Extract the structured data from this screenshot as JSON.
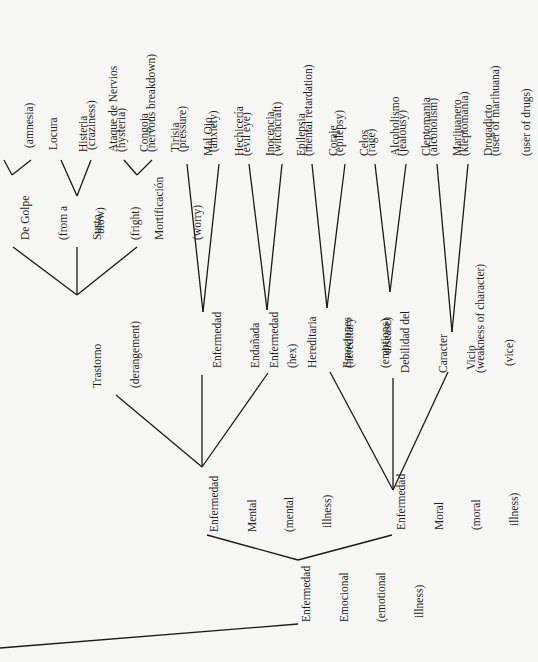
{
  "diagram": {
    "root": {
      "label": [
        "Enfermedad",
        "Emocional",
        "(emotional",
        "illness)"
      ],
      "children": [
        {
          "label": [
            "Enfermedad",
            "Mental",
            "(mental",
            "illness)"
          ],
          "children": [
            {
              "label": [
                "Trastorno",
                "(derangement)"
              ],
              "children": [
                {
                  "label": [
                    "De Golpe",
                    "(from a",
                    "blow)"
                  ],
                  "children": [
                    {
                      "label": [
                        "Amnesia",
                        "(amnesia)"
                      ]
                    },
                    {
                      "label": [
                        "Locura",
                        "(craziness)"
                      ]
                    }
                  ]
                },
                {
                  "label": [
                    "Susto",
                    "(fright)"
                  ],
                  "children": [
                    {
                      "label": [
                        "Histeria",
                        "(hysteria)"
                      ]
                    },
                    {
                      "label": [
                        "Ataque de Nervios",
                        "(nervous breakdown)"
                      ]
                    }
                  ]
                },
                {
                  "label": [
                    "Mortificación",
                    "(worry)"
                  ],
                  "children": [
                    {
                      "label": [
                        "Congoja",
                        "(pressure)"
                      ]
                    },
                    {
                      "label": [
                        "Tirisia",
                        "(anxiety)"
                      ]
                    }
                  ]
                }
              ]
            },
            {
              "label": [
                "Enfermedad",
                "Endañada",
                "(hex)"
              ],
              "children": [
                {
                  "label": [
                    "Mal Ojo",
                    "(evil eye)"
                  ]
                },
                {
                  "label": [
                    "Hechicería",
                    "(witchcraft)"
                  ]
                }
              ]
            },
            {
              "label": [
                "Enfermedad",
                "Hereditaria",
                "(hereditary",
                "disease)"
              ],
              "children": [
                {
                  "label": [
                    "Inocencia",
                    "(mental retardation)"
                  ]
                },
                {
                  "label": [
                    "Epilepsia",
                    "(epilepsy)"
                  ]
                }
              ]
            }
          ]
        },
        {
          "label": [
            "Enfermedad",
            "Moral",
            "(moral",
            "illness)"
          ],
          "children": [
            {
              "label": [
                "Emociones",
                "(emotions)"
              ],
              "children": [
                {
                  "label": [
                    "Coraje",
                    "(rage)"
                  ]
                },
                {
                  "label": [
                    "Celos",
                    "(jealousy)"
                  ]
                }
              ]
            },
            {
              "label": [
                "Debilidad del",
                "Caracter",
                "(weakness of character)"
              ],
              "children": [
                {
                  "label": [
                    "Alcoholismo",
                    "(alcoholism)"
                  ]
                },
                {
                  "label": [
                    "Cleptomania",
                    "(kleptomania)"
                  ]
                }
              ]
            },
            {
              "label": [
                "Vicio",
                "(vice)"
              ],
              "children": [
                {
                  "label": [
                    "Marijuanero",
                    "(user of marihuana)"
                  ]
                },
                {
                  "label": [
                    "Drogadicto",
                    "(user of drugs)"
                  ]
                }
              ]
            }
          ]
        }
      ]
    }
  },
  "labels": {
    "amnesia": [
      "(amnesia)"
    ],
    "degolpe": [
      "De Golpe",
      "(from a",
      "blow)"
    ],
    "locura": [
      "Locura",
      "(craziness)"
    ],
    "histeria": [
      "Histeria",
      "(hysteria)"
    ],
    "ataque": [
      "Ataque de Nervios",
      "(nervous breakdown)"
    ],
    "susto": [
      "Susto",
      "(fright)"
    ],
    "congoja": [
      "Congoja",
      "(pressure)"
    ],
    "tirisia": [
      "Tirisia",
      "(anxiety)"
    ],
    "mortificacion": [
      "Mortificación",
      "(worry)"
    ],
    "trastorno": [
      "Trastorno",
      "(derangement)"
    ],
    "malojo": [
      "Mal Ojo",
      "(evil eye)"
    ],
    "hechiceria": [
      "Hechicería",
      "(witchcraft)"
    ],
    "endanada": [
      "Enfermedad",
      "Endañada",
      "(hex)"
    ],
    "inocencia": [
      "Inocencia",
      "(mental retardation)"
    ],
    "epilepsia": [
      "Epilepsia",
      "(epilepsy)"
    ],
    "hereditaria": [
      "Enfermedad",
      "Hereditaria",
      "(hereditary",
      "disease)"
    ],
    "coraje": [
      "Coraje",
      "(rage)"
    ],
    "celos": [
      "Celos",
      "(jealousy)"
    ],
    "emociones": [
      "Emociones",
      "(emotions)"
    ],
    "alcoholismo": [
      "Alcoholismo",
      "(alcoholism)"
    ],
    "cleptomania": [
      "Cleptomania",
      "(kleptomania)"
    ],
    "debilidad": [
      "Debilidad del",
      "Caracter",
      "(weakness of character)"
    ],
    "marijuanero": [
      "Marijuanero",
      "(user of marihuana)"
    ],
    "drogadicto": [
      "Drogadicto",
      "(user of drugs)"
    ],
    "vicio": [
      "Vicio",
      "(vice)"
    ],
    "mental": [
      "Enfermedad",
      "Mental",
      "(mental",
      "illness)"
    ],
    "moral": [
      "Enfermedad",
      "Moral",
      "(moral",
      "illness)"
    ],
    "emocional": [
      "Enfermedad",
      "Emocional",
      "(emotional",
      "illness)"
    ]
  }
}
